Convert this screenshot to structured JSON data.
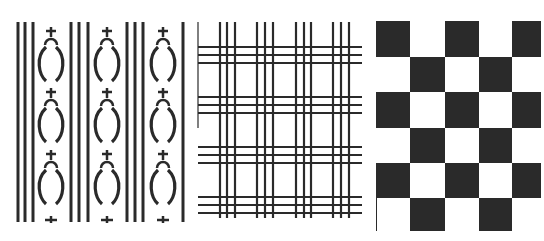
{
  "figure": {
    "ink_color": "#2a2a2a",
    "background_color": "#ffffff",
    "panels": [
      {
        "id": "striped-motif",
        "type": "vertical stripes with gourd motifs",
        "stripe_groups_x": [
          [
            18,
            25,
            33
          ],
          [
            71,
            79,
            88
          ],
          [
            127,
            135,
            143
          ],
          [
            183
          ]
        ],
        "motif_columns_x": [
          51,
          107,
          163
        ],
        "motif_rows_y": [
          27,
          88,
          150
        ],
        "end_cross_y": 220
      },
      {
        "id": "plaid-grid",
        "type": "tartan line grid",
        "vertical_groups_x": [
          [
            220,
            227,
            235
          ],
          [
            257,
            265,
            273
          ],
          [
            296,
            304,
            311
          ],
          [
            333,
            341,
            349
          ]
        ],
        "horizontal_groups_y": [
          [
            47,
            55,
            63
          ],
          [
            97,
            105,
            113
          ],
          [
            147,
            155,
            163
          ],
          [
            197,
            205,
            213
          ]
        ]
      },
      {
        "id": "checkerboard",
        "type": "checkerboard",
        "columns": 5,
        "rows": 6,
        "col_edges_x": [
          376,
          410,
          445,
          479,
          512,
          541
        ],
        "row_edges_y": [
          21,
          57,
          92,
          128,
          163,
          198,
          231
        ],
        "dark_first": true
      }
    ]
  }
}
